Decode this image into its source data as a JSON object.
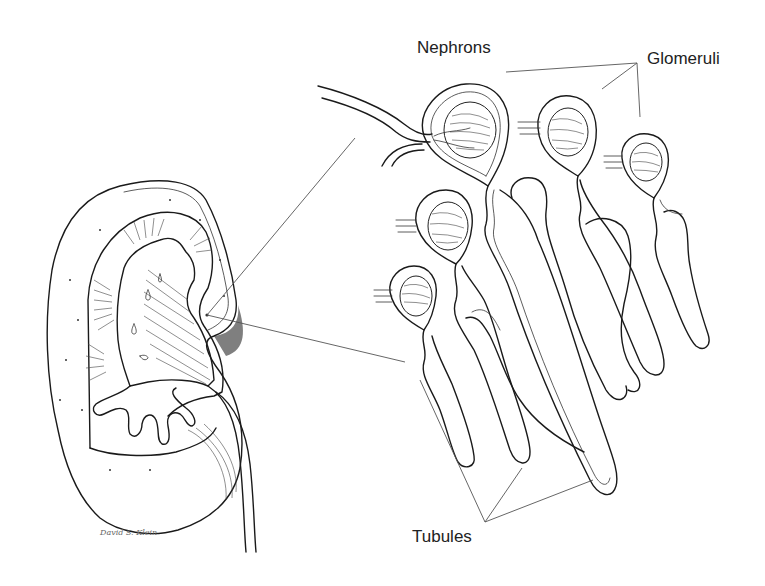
{
  "figure": {
    "labels": {
      "nephrons": "Nephrons",
      "glomeruli": "Glomeruli",
      "tubules": "Tubules"
    },
    "signature": "David S. Klein"
  },
  "colors": {
    "background": "#ffffff",
    "ink": "#1a1a1a",
    "label_text": "#222222",
    "leader_lines": "#555555"
  }
}
